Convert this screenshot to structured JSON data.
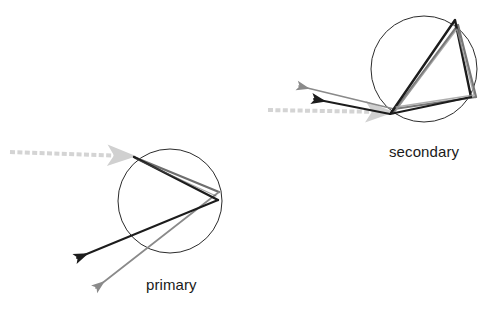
{
  "figure": {
    "background_color": "#ffffff",
    "width": 490,
    "height": 309
  },
  "colors": {
    "droplet_outline": "#2b2b2b",
    "ray_dark": "#1c1c1c",
    "ray_gray": "#6e6e6e",
    "ray_mid": "#4a4a4a",
    "incident_ray": "#d4d4d4",
    "label_text": "#1a1a1a"
  },
  "labels": {
    "primary": "primary",
    "secondary": "secondary"
  },
  "diagrams": [
    {
      "name": "primary",
      "label": "primary",
      "internal_reflections": 1,
      "droplet": {
        "cx": 170,
        "cy": 201,
        "r": 52
      },
      "incident_ray": {
        "from": [
          10,
          152
        ],
        "to": [
          134,
          156
        ],
        "style": "dashed-arrow",
        "color": "#d4d4d4"
      },
      "rays": [
        {
          "name": "dark-ray",
          "color": "#1c1c1c",
          "width": 2.0,
          "points": [
            [
              134,
              157
            ],
            [
              218,
              200
            ],
            [
              131,
              237
            ],
            [
              78,
              258
            ]
          ],
          "arrow_at": [
            78,
            258
          ]
        },
        {
          "name": "gray-ray",
          "color": "#6e6e6e",
          "width": 1.8,
          "points": [
            [
              134,
              157
            ],
            [
              219,
              191
            ],
            [
              218,
              200
            ],
            [
              96,
              288
            ]
          ],
          "arrow_at": [
            96,
            288
          ]
        }
      ]
    },
    {
      "name": "secondary",
      "label": "secondary",
      "internal_reflections": 2,
      "droplet": {
        "cx": 424,
        "cy": 69,
        "r": 53
      },
      "incident_ray": {
        "from": [
          268,
          110
        ],
        "to": [
          392,
          112
        ],
        "style": "dashed-arrow",
        "color": "#d4d4d4"
      },
      "rays": [
        {
          "name": "dark-ray",
          "color": "#1c1c1c",
          "width": 2.0,
          "points": [
            [
              392,
              112
            ],
            [
              455,
              21
            ],
            [
              472,
              97
            ],
            [
              313,
              98
            ]
          ],
          "arrow_at": [
            313,
            98
          ]
        },
        {
          "name": "gray-ray",
          "color": "#6e6e6e",
          "width": 1.8,
          "points": [
            [
              392,
              112
            ],
            [
              456,
              23
            ],
            [
              476,
              96
            ],
            [
              298,
              85
            ]
          ],
          "arrow_at": [
            298,
            85
          ]
        }
      ]
    }
  ]
}
